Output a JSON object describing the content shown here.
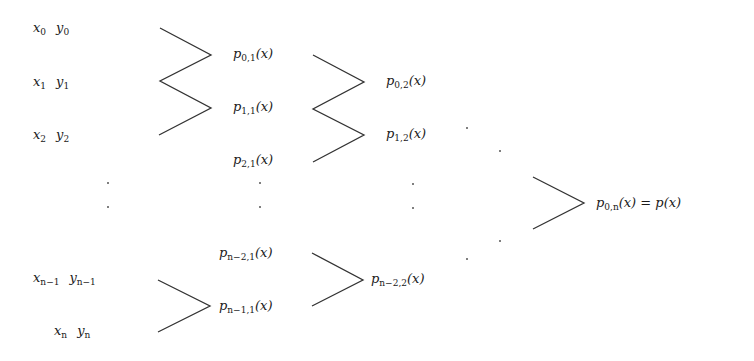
{
  "diagram": {
    "stroke_color": "#333333",
    "data_points": [
      {
        "x": "x",
        "x_sub": "0",
        "y": "y",
        "y_sub": "0"
      },
      {
        "x": "x",
        "x_sub": "1",
        "y": "y",
        "y_sub": "1"
      },
      {
        "x": "x",
        "x_sub": "2",
        "y": "y",
        "y_sub": "2"
      },
      {
        "x": "x",
        "x_sub": "n−1",
        "y": "y",
        "y_sub": "n−1"
      },
      {
        "x": "x",
        "x_sub": "n",
        "y": "y",
        "y_sub": "n"
      }
    ],
    "column1": [
      {
        "p": "p",
        "sub": "0,1",
        "arg": "(x)"
      },
      {
        "p": "p",
        "sub": "1,1",
        "arg": "(x)"
      },
      {
        "p": "p",
        "sub": "2,1",
        "arg": "(x)"
      },
      {
        "p": "p",
        "sub": "n−2,1",
        "arg": "(x)"
      },
      {
        "p": "p",
        "sub": "n−1,1",
        "arg": "(x)"
      }
    ],
    "column2": [
      {
        "p": "p",
        "sub": "0,2",
        "arg": "(x)"
      },
      {
        "p": "p",
        "sub": "1,2",
        "arg": "(x)"
      },
      {
        "p": "p",
        "sub": "n−2,2",
        "arg": "(x)"
      }
    ],
    "result": {
      "p": "p",
      "sub": "0,n",
      "arg": "(x)",
      "eq": " = p(x)"
    }
  }
}
